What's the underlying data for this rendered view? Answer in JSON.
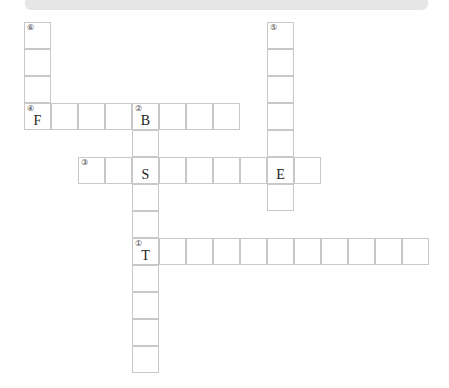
{
  "header": {
    "left_text": "",
    "right_text": ""
  },
  "puzzle": {
    "cell_size": 27,
    "words": [
      {
        "number": "①",
        "direction": "across",
        "x": 132,
        "y": 238,
        "length": 11,
        "letters": {
          "0": "T"
        }
      },
      {
        "number": "②",
        "direction": "down",
        "x": 132,
        "y": 103,
        "length": 10,
        "letters": {
          "0": "B",
          "2": "S",
          "5": "T"
        }
      },
      {
        "number": "③",
        "direction": "across",
        "x": 78,
        "y": 157,
        "length": 9,
        "letters": {
          "2": "S",
          "7": "E"
        }
      },
      {
        "number": "④",
        "direction": "across",
        "x": 24,
        "y": 103,
        "length": 8,
        "letters": {
          "0": "F",
          "4": "B"
        }
      },
      {
        "number": "⑤",
        "direction": "down",
        "x": 267,
        "y": 22,
        "length": 7,
        "letters": {
          "5": "E"
        }
      },
      {
        "number": "⑥",
        "direction": "down",
        "x": 24,
        "y": 22,
        "length": 4,
        "letters": {
          "3": "F"
        }
      }
    ]
  }
}
